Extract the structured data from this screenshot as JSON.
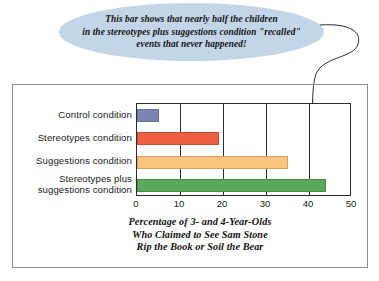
{
  "callout": {
    "text": "This bar shows that nearly half the children\nin the stereotypes plus suggestions condition \"recalled\"\nevents that never happened!",
    "fill_color": "#c3d6e9",
    "pointer_target": "stereotypes-plus-suggestions-bar"
  },
  "chart_data": {
    "type": "bar",
    "orientation": "horizontal",
    "title": "",
    "xlabel": "Percentage of 3- and 4-Year-Olds\nWho Claimed to See Sam Stone\nRip the Book or Soil the Bear",
    "ylabel": "",
    "xlim": [
      0,
      50
    ],
    "xticks": [
      0,
      10,
      20,
      30,
      40,
      50
    ],
    "grid": true,
    "legend": "none",
    "categories": [
      "Control condition",
      "Stereotypes condition",
      "Suggestions condition",
      "Stereotypes plus\nsuggestions condition"
    ],
    "values": [
      5,
      19,
      35,
      44
    ],
    "colors": [
      "#7b85b5",
      "#ef5f43",
      "#fbc57e",
      "#5aa859"
    ]
  },
  "axis_caption": "Percentage of 3- and 4-Year-Olds\nWho Claimed to See Sam Stone\nRip the Book or Soil the Bear"
}
